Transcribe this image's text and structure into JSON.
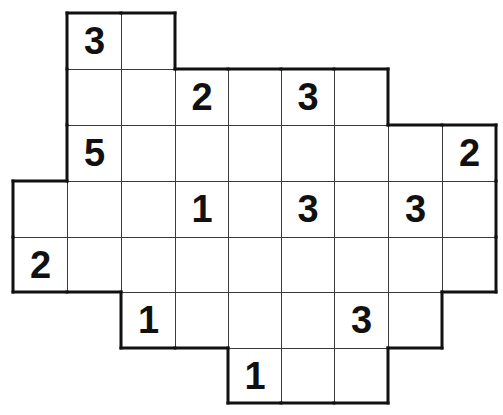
{
  "puzzle": {
    "grid": {
      "cols": 9,
      "rows": 7,
      "origin_x": 13,
      "origin_y": 13,
      "col_edges": [
        13,
        67,
        121,
        175,
        228,
        281,
        334,
        388,
        442,
        496
      ],
      "row_edges": [
        13,
        69,
        125,
        181,
        237,
        292,
        348,
        403
      ],
      "line_color": "#3a3a3a",
      "border_color": "#111111"
    },
    "rows": [
      {
        "cols": [
          1,
          2
        ]
      },
      {
        "cols": [
          1,
          2,
          3,
          4,
          5,
          6
        ]
      },
      {
        "cols": [
          1,
          2,
          3,
          4,
          5,
          6,
          7,
          8
        ]
      },
      {
        "cols": [
          0,
          1,
          2,
          3,
          4,
          5,
          6,
          7,
          8
        ]
      },
      {
        "cols": [
          0,
          1,
          2,
          3,
          4,
          5,
          6,
          7,
          8
        ]
      },
      {
        "cols": [
          2,
          3,
          4,
          5,
          6,
          7
        ]
      },
      {
        "cols": [
          4,
          5,
          6
        ]
      }
    ],
    "clues": [
      {
        "row": 0,
        "col": 1,
        "value": "3"
      },
      {
        "row": 1,
        "col": 3,
        "value": "2"
      },
      {
        "row": 1,
        "col": 5,
        "value": "3"
      },
      {
        "row": 2,
        "col": 1,
        "value": "5"
      },
      {
        "row": 2,
        "col": 8,
        "value": "2"
      },
      {
        "row": 3,
        "col": 3,
        "value": "1"
      },
      {
        "row": 3,
        "col": 5,
        "value": "3"
      },
      {
        "row": 3,
        "col": 7,
        "value": "3"
      },
      {
        "row": 4,
        "col": 0,
        "value": "2"
      },
      {
        "row": 5,
        "col": 2,
        "value": "1"
      },
      {
        "row": 5,
        "col": 6,
        "value": "3"
      },
      {
        "row": 6,
        "col": 4,
        "value": "1"
      }
    ]
  }
}
